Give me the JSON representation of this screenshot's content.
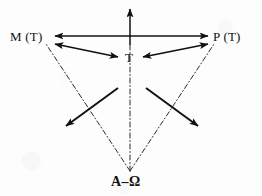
{
  "figure": {
    "width": 262,
    "height": 196,
    "background_color": "#fdfdfd",
    "ink_color": "#111111"
  },
  "nodes": {
    "left": {
      "label": "M (T)",
      "x": 10,
      "y": 30
    },
    "right": {
      "label": "P (T)",
      "x": 213,
      "y": 30
    },
    "center": {
      "label": "T",
      "x": 125,
      "y": 51
    },
    "origin": {
      "label": "A–Ω",
      "x": 111,
      "y": 175
    }
  },
  "connectors": {
    "horizontal_double_arrow": {
      "name": "M(T) ↔ P(T)",
      "style": "solid",
      "arrowheads": "both"
    },
    "vertical_up_arrow": {
      "name": "T ↑ upward",
      "style": "solid",
      "arrowheads": "up"
    },
    "left_to_center_arrow": {
      "name": "M(T) ↔ T",
      "style": "solid",
      "arrowheads": "both"
    },
    "right_to_center_arrow": {
      "name": "P(T) ↔ T",
      "style": "solid",
      "arrowheads": "both"
    },
    "inner_arrow_down_left": {
      "name": "diagonal down-left",
      "style": "solid",
      "arrowheads": "end"
    },
    "inner_arrow_down_right": {
      "name": "diagonal down-right",
      "style": "solid",
      "arrowheads": "end"
    },
    "origin_to_left_dashdot": {
      "name": "A–Ω ⇢ M(T)",
      "style": "dash-dot",
      "arrowheads": "none"
    },
    "origin_to_center_dashdot": {
      "name": "A–Ω ⇢ T",
      "style": "dash-dot",
      "arrowheads": "none"
    },
    "origin_to_right_dashdot": {
      "name": "A–Ω ⇢ P(T)",
      "style": "dash-dot",
      "arrowheads": "none"
    }
  }
}
